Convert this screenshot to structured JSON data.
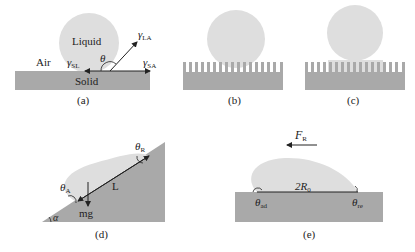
{
  "colors": {
    "solid": "#a9a9a9",
    "liquid": "#dedede",
    "line": "#222222",
    "text": "#222222"
  },
  "panels": {
    "a": {
      "caption": "(a)",
      "labels": {
        "air": "Air",
        "liquid": "Liquid",
        "solid": "Solid",
        "gamma": "γ",
        "gamma_sl_sub": "SL",
        "gamma_la_sub": "LA",
        "gamma_sa_sub": "SA",
        "theta": "θ"
      }
    },
    "b": {
      "caption": "(b)"
    },
    "c": {
      "caption": "(c)"
    },
    "d": {
      "caption": "(d)",
      "labels": {
        "theta": "θ",
        "theta_a_sub": "A",
        "theta_r_sub": "R",
        "length": "L",
        "weight": "mg",
        "alpha": "α"
      }
    },
    "e": {
      "caption": "(e)",
      "labels": {
        "force": "F",
        "force_sub": "R",
        "diameter": "2R",
        "diameter_sub": "0",
        "theta": "θ",
        "theta_ad_sub": "ad",
        "theta_re_sub": "re"
      }
    }
  }
}
